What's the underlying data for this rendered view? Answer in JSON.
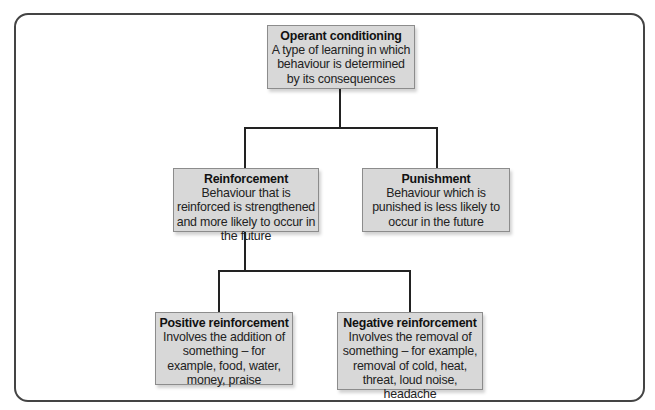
{
  "diagram": {
    "type": "hierarchy",
    "nodes": {
      "root": {
        "title": "Operant conditioning",
        "description": "A type of learning in which behaviour is determined by its consequences"
      },
      "reinforcement": {
        "title": "Reinforcement",
        "description": "Behaviour that is reinforced is strengthened and more likely to occur in the future"
      },
      "punishment": {
        "title": "Punishment",
        "description": "Behaviour which is punished is less likely to occur in the future"
      },
      "positive": {
        "title": "Positive reinforcement",
        "description": "Involves the addition of something – for example, food, water, money, praise"
      },
      "negative": {
        "title": "Negative reinforcement",
        "description": "Involves the removal of something – for example, removal of cold, heat, threat, loud noise, headache"
      }
    },
    "edges": [
      {
        "from": "root",
        "to": "reinforcement"
      },
      {
        "from": "root",
        "to": "punishment"
      },
      {
        "from": "reinforcement",
        "to": "positive"
      },
      {
        "from": "reinforcement",
        "to": "negative"
      }
    ],
    "colors": {
      "node_fill": "#d8d8d8",
      "node_border": "#8c8c8c",
      "connector": "#222222",
      "frame_border": "#444444"
    }
  }
}
